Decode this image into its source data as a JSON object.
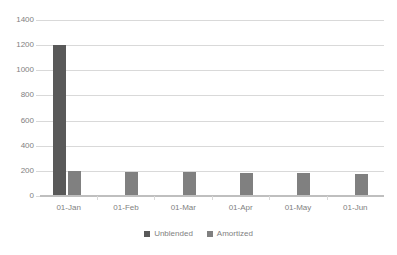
{
  "chart_data": {
    "type": "bar",
    "title": "",
    "subtitle": "",
    "xlabel": "",
    "ylabel": "",
    "categories": [
      "01-Jan",
      "01-Feb",
      "01-Mar",
      "01-Apr",
      "01-May",
      "01-Jun"
    ],
    "series": [
      {
        "name": "Unblended",
        "color": "#595959",
        "values": [
          1200,
          0,
          0,
          0,
          0,
          0
        ]
      },
      {
        "name": "Amortized",
        "color": "#808080",
        "values": [
          200,
          195,
          190,
          185,
          180,
          175
        ]
      }
    ],
    "ylim": [
      0,
      1400
    ],
    "yticks": [
      0,
      200,
      400,
      600,
      800,
      1000,
      1200,
      1400
    ],
    "ytick_labels": [
      "0",
      "200",
      "400",
      "600",
      "800",
      "1000",
      "1200",
      "1400"
    ],
    "grid": true,
    "grid_axis": "y",
    "grid_color": "#d9d9d9",
    "legend_position": "bottom",
    "background": "#ffffff",
    "axis_label_color": "#7f7f7f"
  }
}
